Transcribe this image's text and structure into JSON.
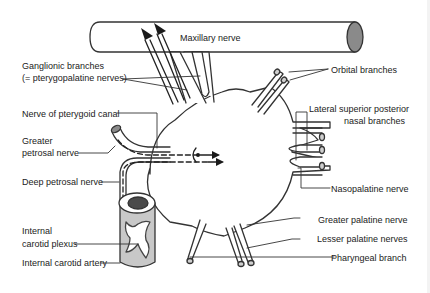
{
  "colors": {
    "stroke": "#333333",
    "fill_gray": "#c8c8c8",
    "fill_dark": "#555555",
    "background": "#ffffff"
  },
  "labels": {
    "maxillary_nerve": "Maxillary nerve",
    "ganglionic_branches_1": "Ganglionic branches",
    "ganglionic_branches_2": "(= pterygopalatine nerves)",
    "nerve_pterygoid_canal": "Nerve of pterygoid canal",
    "greater_petrosal_1": "Greater",
    "greater_petrosal_2": "petrosal nerve",
    "deep_petrosal": "Deep petrosal nerve",
    "internal_carotid_plexus_1": "Internal",
    "internal_carotid_plexus_2": "carotid plexus",
    "internal_carotid_artery": "Internal carotid artery",
    "orbital_branches": "Orbital branches",
    "lateral_superior_posterior_1": "Lateral superior posterior",
    "lateral_superior_posterior_2": "nasal branches",
    "nasopalatine": "Nasopalatine nerve",
    "greater_palatine": "Greater palatine nerve",
    "lesser_palatine": "Lesser palatine nerves",
    "pharyngeal": "Pharyngeal branch"
  }
}
